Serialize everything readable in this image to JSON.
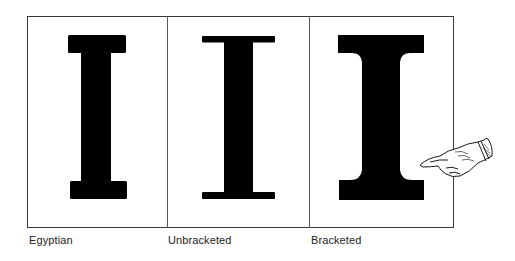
{
  "figure": {
    "panels": [
      {
        "id": "egyptian",
        "label": "Egyptian",
        "glyph": "I",
        "serif_style": "slab, square"
      },
      {
        "id": "unbracketed",
        "label": "Unbracketed",
        "glyph": "I",
        "serif_style": "thin, unbracketed"
      },
      {
        "id": "bracketed",
        "label": "Bracketed",
        "glyph": "I",
        "serif_style": "heavy, bracketed"
      }
    ],
    "pointer": {
      "icon": "pointing-hand-icon",
      "points_to": "bracketed"
    },
    "colors": {
      "ink": "#000000",
      "frame": "#3a3a3a",
      "background": "#ffffff",
      "label": "#222222"
    }
  }
}
